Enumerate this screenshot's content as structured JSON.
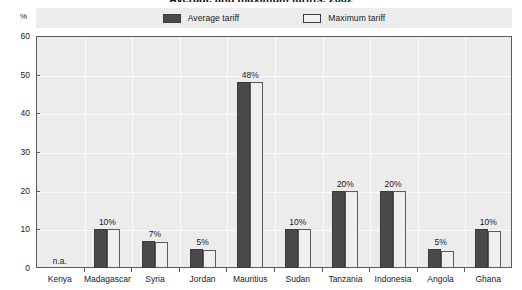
{
  "chart_data": {
    "type": "bar",
    "title": "Average and maximum tariffs, 2002",
    "unit_label": "%",
    "xlabel": "",
    "ylabel": "",
    "ylim": [
      0,
      60
    ],
    "yticks": [
      0,
      10,
      20,
      30,
      40,
      50,
      60
    ],
    "grid": true,
    "legend_position": "top-center",
    "categories": [
      "Kenya",
      "Madagascar",
      "Syria",
      "Jordan",
      "Mauritius",
      "Sudan",
      "Tanzania",
      "Indonesia",
      "Angola",
      "Ghana"
    ],
    "series": [
      {
        "name": "Average tariff",
        "color": "#4a4a4a",
        "values": [
          null,
          10,
          7,
          5,
          48,
          10,
          20,
          20,
          5,
          10
        ]
      },
      {
        "name": "Maximum tariff",
        "color": "#efefef",
        "values": [
          null,
          10,
          6.8,
          4.6,
          48,
          10,
          20,
          20,
          4.5,
          9.6
        ]
      }
    ],
    "data_labels": [
      "n.a.",
      "10%",
      "7%",
      "5%",
      "48%",
      "10%",
      "20%",
      "20%",
      "5%",
      "10%"
    ],
    "annotations": [
      {
        "category": "Kenya",
        "text": "n.a."
      }
    ]
  },
  "legend": {
    "entries": [
      {
        "label": "Average tariff",
        "swatch": "avg"
      },
      {
        "label": "Maximum tariff",
        "swatch": "max"
      }
    ]
  }
}
